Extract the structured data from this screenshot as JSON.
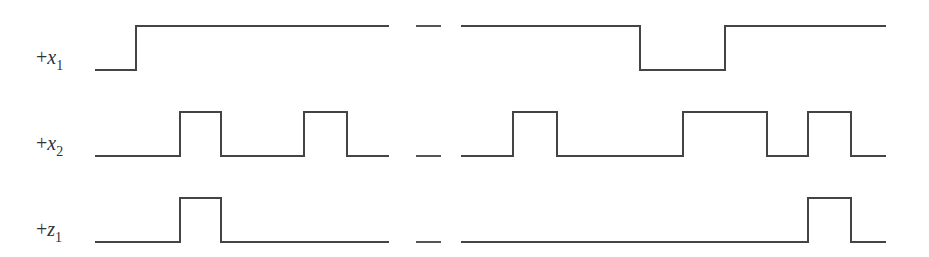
{
  "signals": [
    {
      "id": "x1",
      "label_prefix": "+",
      "label_var": "x",
      "label_sub": "1",
      "initial": 0,
      "segments": [
        {
          "start": 0,
          "end": 7,
          "transitions": [
            1.0
          ]
        },
        {
          "start": 9,
          "end": 19,
          "transitions": [
            13.4,
            15.4
          ]
        }
      ]
    },
    {
      "id": "x2",
      "label_prefix": "+",
      "label_var": "x",
      "label_sub": "2",
      "initial": 0,
      "segments": [
        {
          "start": 0,
          "end": 7,
          "transitions": [
            2.0,
            3.0,
            5.0,
            6.0
          ]
        },
        {
          "start": 9,
          "end": 19,
          "transitions": [
            10.2,
            11.3,
            14.4,
            16.4,
            17.4,
            18.4
          ]
        }
      ]
    },
    {
      "id": "z1",
      "label_prefix": "+",
      "label_var": "z",
      "label_sub": "1",
      "initial": 0,
      "segments": [
        {
          "start": 0,
          "end": 7,
          "transitions": [
            2.0,
            3.0
          ]
        },
        {
          "start": 9,
          "end": 19,
          "transitions": [
            17.4,
            18.4
          ]
        }
      ]
    }
  ],
  "break_marker": "time-break"
}
